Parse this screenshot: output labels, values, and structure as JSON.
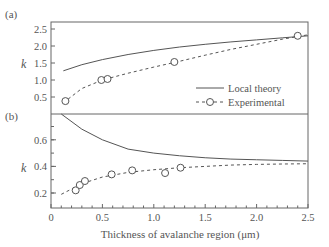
{
  "chart_data": [
    {
      "panel": "(a)",
      "type": "line",
      "ylabel": "k",
      "xlabel": "Thickness of avalanche region (μm)",
      "xlim": [
        0,
        2.5
      ],
      "ylim": [
        0,
        2.75
      ],
      "yticks": [
        0.5,
        1.0,
        1.5,
        2.0,
        2.5
      ],
      "ytick_labels": [
        "0.5",
        "1.0",
        "1.5",
        "2.0",
        "2.5"
      ],
      "grid": false,
      "legend_position": "lower right",
      "series": [
        {
          "name": "Local theory",
          "style": "solid",
          "x": [
            0.12,
            0.3,
            0.5,
            0.75,
            1.0,
            1.25,
            1.5,
            1.75,
            2.0,
            2.25,
            2.5
          ],
          "y": [
            1.27,
            1.45,
            1.6,
            1.75,
            1.87,
            1.97,
            2.05,
            2.12,
            2.18,
            2.24,
            2.3
          ]
        },
        {
          "name": "Experimental",
          "style": "dashed-circle",
          "x": [
            0.14,
            0.49,
            0.55,
            1.2,
            2.4
          ],
          "y": [
            0.38,
            1.0,
            1.03,
            1.53,
            2.3
          ],
          "fit_x": [
            0.12,
            0.3,
            0.5,
            0.75,
            1.0,
            1.25,
            1.5,
            1.75,
            2.0,
            2.25,
            2.5
          ],
          "fit_y": [
            0.33,
            0.75,
            1.0,
            1.2,
            1.38,
            1.55,
            1.73,
            1.9,
            2.05,
            2.2,
            2.33
          ]
        }
      ]
    },
    {
      "panel": "(b)",
      "type": "line",
      "ylabel": "k",
      "xlabel": "Thickness of avalanche region (μm)",
      "xlim": [
        0,
        2.5
      ],
      "ylim": [
        0.1,
        0.8
      ],
      "yticks": [
        0.2,
        0.4,
        0.6
      ],
      "ytick_labels": [
        "0.2",
        "0.4",
        "0.6"
      ],
      "xticks": [
        0,
        0.5,
        1.0,
        1.5,
        2.0,
        2.5
      ],
      "xtick_labels": [
        "0",
        "0.5",
        "1.0",
        "1.5",
        "2.0",
        "2.5"
      ],
      "grid": false,
      "series": [
        {
          "name": "Local theory",
          "style": "solid",
          "x": [
            0.1,
            0.3,
            0.5,
            0.75,
            1.0,
            1.25,
            1.5,
            1.75,
            2.0,
            2.25,
            2.5
          ],
          "y": [
            0.8,
            0.68,
            0.6,
            0.53,
            0.5,
            0.48,
            0.465,
            0.455,
            0.45,
            0.445,
            0.44
          ]
        },
        {
          "name": "Experimental",
          "style": "dashed-circle",
          "x": [
            0.24,
            0.28,
            0.33,
            0.59,
            0.79,
            1.11,
            1.26
          ],
          "y": [
            0.22,
            0.26,
            0.29,
            0.34,
            0.37,
            0.35,
            0.39
          ],
          "fit_x": [
            0.1,
            0.3,
            0.5,
            0.75,
            1.0,
            1.25,
            1.5,
            1.75,
            2.0,
            2.25,
            2.5
          ],
          "fit_y": [
            0.19,
            0.27,
            0.32,
            0.355,
            0.375,
            0.39,
            0.4,
            0.41,
            0.415,
            0.418,
            0.42
          ]
        }
      ]
    }
  ],
  "labels": {
    "panel_a": "(a)",
    "panel_b": "(b)",
    "ylabel_a": "k",
    "ylabel_b": "k",
    "xlabel": "Thickness of avalanche region (μm)",
    "legend_local": "Local theory",
    "legend_experimental": "Experimental"
  }
}
